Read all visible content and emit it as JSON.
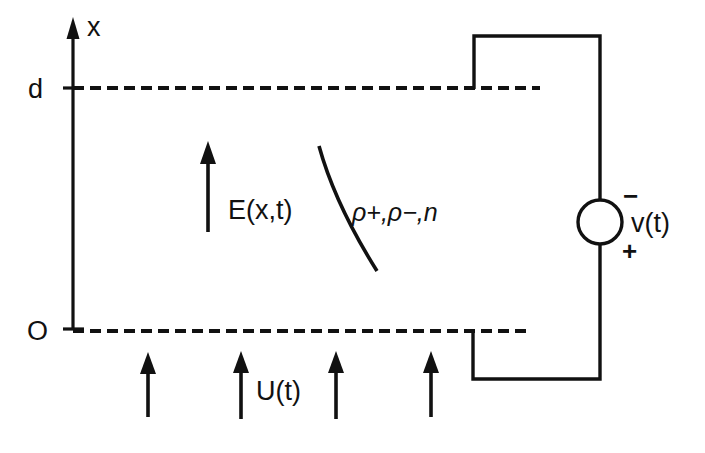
{
  "figure": {
    "background_color": "#ffffff",
    "ink_color": "#111111",
    "width": 705,
    "height": 453
  },
  "axis": {
    "name": "x-axis",
    "label": "x",
    "arrow_direction": "up",
    "ticks": [
      {
        "label": "d",
        "position": "top",
        "value": "d"
      },
      {
        "label": "O",
        "position": "origin",
        "value": "0"
      }
    ]
  },
  "boundaries": {
    "top_plate_label": "d",
    "bottom_plate_label": "O",
    "line_style": "dashed"
  },
  "field": {
    "label": "E(x,t)",
    "arrow_direction": "up",
    "arrow_count": 1
  },
  "charges": {
    "label": "ρ+,ρ−,n",
    "leader": "curve"
  },
  "flow": {
    "label": "U(t)",
    "arrow_direction": "up",
    "arrow_count": 4
  },
  "source": {
    "label": "v(t)",
    "symbol": "circle",
    "terminal_top": "−",
    "terminal_bottom": "+"
  }
}
